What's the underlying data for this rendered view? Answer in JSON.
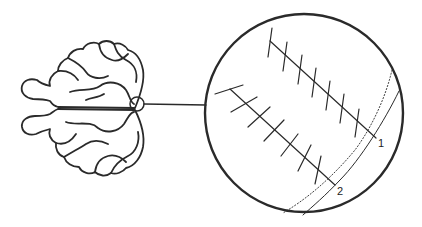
{
  "figure": {
    "colors": {
      "stroke": "#222222",
      "background": "#ffffff"
    },
    "brain": {
      "name": "brain-dorsal-view",
      "highlight": "small-circle-on-right-hemisphere-edge"
    },
    "magnifier": {
      "name": "magnified-view-circle"
    },
    "lines": [
      {
        "id": "line-1",
        "label": "1",
        "ticks": 7
      },
      {
        "id": "line-2",
        "label": "2",
        "ticks": 7
      }
    ],
    "boundaries": [
      {
        "style": "solid",
        "name": "surface-boundary"
      },
      {
        "style": "dotted",
        "name": "inner-boundary"
      }
    ]
  }
}
